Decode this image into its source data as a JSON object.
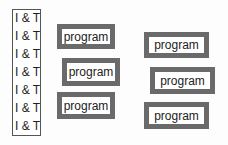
{
  "left_column": {
    "items": [
      "I & T",
      "I & T",
      "I & T",
      "I & T",
      "I & T",
      "I & T",
      "I & T"
    ]
  },
  "programs": {
    "left": [
      "program",
      "program",
      "program"
    ],
    "right": [
      "program",
      "program",
      "program"
    ]
  },
  "colors": {
    "box_border": "#6a6a6a",
    "column_border": "#555555",
    "text": "#222222"
  }
}
